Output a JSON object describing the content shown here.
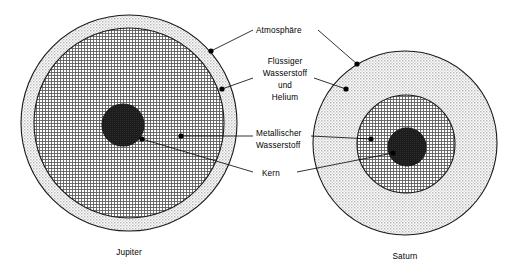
{
  "figure": {
    "title_visible": false,
    "background_color": "#ffffff",
    "line_color": "#000000"
  },
  "labels": {
    "atmosphere": "Atmosphäre",
    "liquid_hydrogen_line1": "Flüssiger",
    "liquid_hydrogen_line2": "Wasserstoff",
    "liquid_hydrogen_line3": "und",
    "liquid_hydrogen_line4": "Helium",
    "metallic_hydrogen_line1": "Metallischer",
    "metallic_hydrogen_line2": "Wasserstoff",
    "core": "Kern"
  },
  "planets": [
    {
      "name": "Jupiter",
      "center_x": 129,
      "center_y": 123,
      "layers": [
        {
          "layer_name": "Atmosphäre",
          "radius": 108,
          "fill_color": "#efefef",
          "pattern": "fine-dot"
        },
        {
          "layer_name": "Flüssiger Wasserstoff und Helium",
          "radius": 95,
          "fill_color": "#c9c9c9",
          "pattern": "cross-hatch"
        },
        {
          "layer_name": "Kern",
          "radius": 21,
          "fill_color": "#1c1c1c",
          "pattern": "solid-dark"
        }
      ]
    },
    {
      "name": "Saturn",
      "center_x": 405,
      "center_y": 143,
      "layers": [
        {
          "layer_name": "Atmosphäre",
          "radius": 92,
          "fill_color": "#efefef",
          "pattern": "fine-dot"
        },
        {
          "layer_name": "Flüssiger Wasserstoff und Helium",
          "radius": 49,
          "fill_color": "#c9c9c9",
          "pattern": "cross-hatch"
        },
        {
          "layer_name": "Kern",
          "radius": 19,
          "fill_color": "#1c1c1c",
          "pattern": "solid-dark"
        }
      ]
    }
  ],
  "callouts": [
    {
      "id": "atmosphere-jupiter",
      "label": "Atmosphäre",
      "dot_x": 211,
      "dot_y": 51,
      "text_x": 256,
      "text_y": 33
    },
    {
      "id": "atmosphere-saturn",
      "label": "Atmosphäre",
      "dot_x": 357,
      "dot_y": 64,
      "text_x": 318,
      "text_y": 33
    },
    {
      "id": "liquid-hydrogen-jupiter",
      "label": "Flüssiger Wasserstoff und Helium",
      "dot_x": 222,
      "dot_y": 89,
      "text_x": 256,
      "text_y": 64
    },
    {
      "id": "liquid-hydrogen-saturn",
      "label": "Flüssiger Wasserstoff und Helium",
      "dot_x": 346,
      "dot_y": 89,
      "text_x": 318,
      "text_y": 64
    },
    {
      "id": "metallic-hydrogen-jupiter",
      "label": "Metallischer Wasserstoff",
      "dot_x": 181,
      "dot_y": 136,
      "text_x": 256,
      "text_y": 133
    },
    {
      "id": "metallic-hydrogen-saturn",
      "label": "Metallischer Wasserstoff",
      "dot_x": 371,
      "dot_y": 139,
      "text_x": 318,
      "text_y": 133
    },
    {
      "id": "core-jupiter",
      "label": "Kern",
      "dot_x": 142,
      "dot_y": 139,
      "text_x": 256,
      "text_y": 173
    },
    {
      "id": "core-saturn",
      "label": "Kern",
      "dot_x": 393,
      "dot_y": 153,
      "text_x": 300,
      "text_y": 173
    }
  ]
}
